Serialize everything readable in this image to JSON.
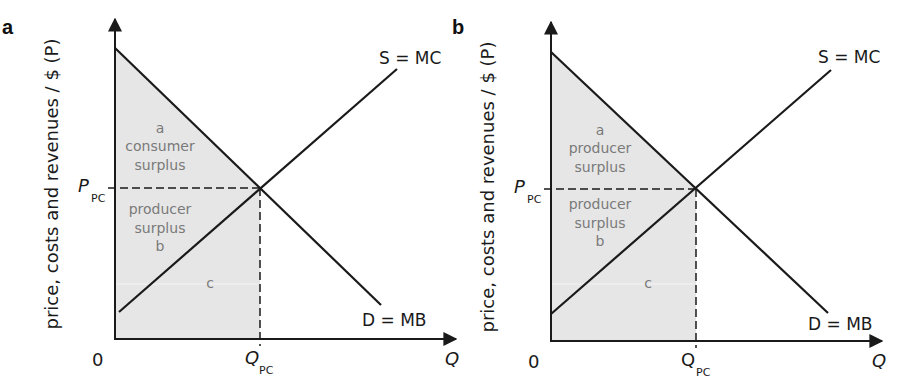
{
  "panels": [
    {
      "id": "a",
      "label": "a",
      "y_axis_label": "price, costs and revenues / $ (P)",
      "x_axis_label": "Q",
      "origin_label": "0",
      "price_label": {
        "main": "P",
        "sub": "PC"
      },
      "quantity_label": {
        "main": "Q",
        "sub": "PC",
        "italic": true
      },
      "supply_label": "S = MC",
      "demand_label": "D = MB",
      "regions": {
        "a": [
          "a",
          "consumer",
          "surplus"
        ],
        "b": [
          "producer",
          "surplus",
          "b"
        ],
        "c": [
          "c"
        ]
      }
    },
    {
      "id": "b",
      "label": "b",
      "y_axis_label": "price, costs and revenues / $ (P)",
      "x_axis_label": "Q",
      "origin_label": "0",
      "price_label": {
        "main": "P",
        "sub": "PC"
      },
      "quantity_label": {
        "main": "Q",
        "sub": "PC",
        "italic": false
      },
      "supply_label": "S = MC",
      "demand_label": "D = MB",
      "regions": {
        "a": [
          "a",
          "producer",
          "surplus"
        ],
        "b": [
          "producer",
          "surplus",
          "b"
        ],
        "c": [
          "c"
        ]
      }
    }
  ],
  "colors": {
    "line": "#1a1a1a",
    "shade": "#e6e6e6",
    "region_text": "#7a7a7a"
  }
}
